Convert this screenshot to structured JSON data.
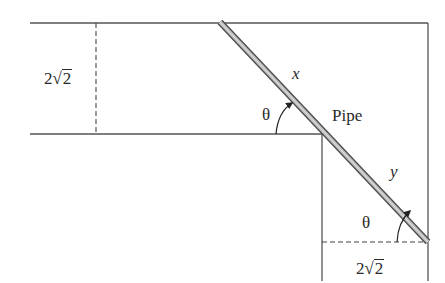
{
  "diagram": {
    "colors": {
      "line": "#555555",
      "pipe_fill": "#bdbdbd",
      "pipe_edge": "#4a4a4a",
      "text": "#2a2a2a",
      "background": "#ffffff"
    },
    "labels": {
      "top_width_coeff": "2",
      "top_width_radicand": "2",
      "bottom_width_coeff": "2",
      "bottom_width_radicand": "2",
      "segment_x": "x",
      "segment_y": "y",
      "angle_upper": "θ",
      "angle_lower": "θ",
      "pipe": "Pipe"
    }
  }
}
